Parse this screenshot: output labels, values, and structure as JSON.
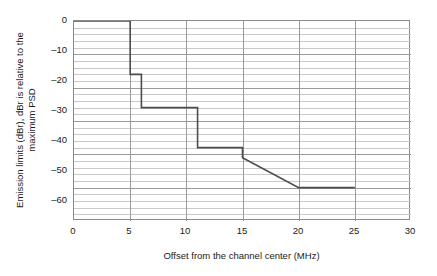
{
  "chart_data": {
    "type": "line",
    "title": "",
    "xlabel": "Offset from the channel center (MHz)",
    "ylabel_line1": "Emission limits (dBr), dBr is relative to the",
    "ylabel_line2": "maximum PSD",
    "xlim": [
      0,
      30
    ],
    "ylim": [
      -60,
      0
    ],
    "xticks": [
      0,
      5,
      10,
      15,
      20,
      25,
      30
    ],
    "xtick_labels": [
      "0",
      "5",
      "10",
      "15",
      "20",
      "25",
      "30"
    ],
    "yticks": [
      0,
      -10,
      -20,
      -30,
      -40,
      -50,
      -60
    ],
    "ytick_labels": [
      "0",
      "–10",
      "–20",
      "–30",
      "–40",
      "–50",
      "–60"
    ],
    "y_minor_step": 2,
    "grid": {
      "horizontal_major": true,
      "horizontal_minor": true,
      "vertical_major": true,
      "vertical_minor": false,
      "major_color": "#9a9a9a",
      "minor_color": "#c9c9c9"
    },
    "legend": null,
    "series": [
      {
        "name": "Transmit spectral mask",
        "color": "#4d4d4d",
        "line_width": 1.6,
        "x": [
          0,
          5,
          5,
          6,
          6,
          11,
          11,
          15,
          15,
          20,
          25
        ],
        "y": [
          0,
          0,
          -16,
          -16,
          -26,
          -26,
          -38,
          -38,
          -41,
          -50,
          -50
        ],
        "points": [
          {
            "x": 0,
            "y": 0
          },
          {
            "x": 5,
            "y": 0
          },
          {
            "x": 5,
            "y": -16
          },
          {
            "x": 6,
            "y": -16
          },
          {
            "x": 6,
            "y": -26
          },
          {
            "x": 11,
            "y": -26
          },
          {
            "x": 11,
            "y": -38
          },
          {
            "x": 15,
            "y": -38
          },
          {
            "x": 15,
            "y": -41
          },
          {
            "x": 20,
            "y": -50
          },
          {
            "x": 25,
            "y": -50
          }
        ]
      }
    ]
  }
}
